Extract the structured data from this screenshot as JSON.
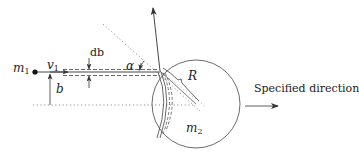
{
  "diagram": {
    "labels": {
      "m1": "m",
      "m1_sub": "1",
      "v1": "v",
      "v1_sub": "1",
      "b": "b",
      "db": "db",
      "alpha": "α",
      "R": "R",
      "m2": "m",
      "m2_sub": "2",
      "specified_direction": "Specified direction"
    },
    "colors": {
      "stroke": "#333333",
      "dotted": "#777777",
      "background": "#ffffff"
    },
    "geometry": {
      "circle_center": [
        196,
        104
      ],
      "circle_radius": 44,
      "contact_point": [
        160,
        71
      ],
      "particle_m1": [
        35,
        71
      ]
    }
  }
}
